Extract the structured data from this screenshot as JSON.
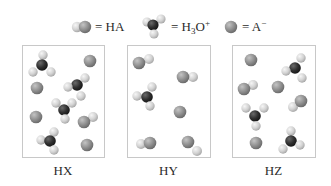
{
  "legend": [
    {
      "species": "HA",
      "label": "= HA",
      "type": "HA"
    },
    {
      "species": "H3O+",
      "label_main": "= H",
      "label_sub": "3",
      "label_mid": "O",
      "label_sup": "+",
      "type": "H3O"
    },
    {
      "species": "A-",
      "label_main": "= A",
      "label_sup": "−",
      "type": "A"
    }
  ],
  "colors": {
    "anion": "#8e8e8e",
    "anion_highlight": "#c4c4c4",
    "hydrogen": "#d6d6d6",
    "hydrogen_highlight": "#f4f4f4",
    "oxygen": "#2e2e2e",
    "oxygen_highlight": "#6a6a6a",
    "box_border": "#c8c8c8"
  },
  "boxes": [
    {
      "label": "HX",
      "x": 22,
      "y": 45,
      "w": 82,
      "h": 112,
      "counts": {
        "HA": 1,
        "H3O+": 4,
        "A-": 4
      },
      "molecules": [
        {
          "type": "H3O",
          "o": [
            42,
            65
          ],
          "h": [
            [
              43,
              55
            ],
            [
              33,
              72
            ],
            [
              51,
              72
            ]
          ]
        },
        {
          "type": "A",
          "at": [
            90,
            61
          ]
        },
        {
          "type": "A",
          "at": [
            37,
            88
          ]
        },
        {
          "type": "H3O",
          "o": [
            77,
            85
          ],
          "h": [
            [
              85,
              78
            ],
            [
              68,
              87
            ],
            [
              81,
              96
            ]
          ]
        },
        {
          "type": "H3O",
          "o": [
            64,
            110
          ],
          "h": [
            [
              56,
              103
            ],
            [
              72,
              103
            ],
            [
              65,
              119
            ]
          ]
        },
        {
          "type": "A",
          "at": [
            36,
            117
          ]
        },
        {
          "type": "HA",
          "a": [
            84,
            122
          ],
          "h": [
            93,
            117
          ]
        },
        {
          "type": "H3O",
          "o": [
            50,
            141
          ],
          "h": [
            [
              54,
              132
            ],
            [
              41,
              140
            ],
            [
              54,
              150
            ]
          ]
        },
        {
          "type": "A",
          "at": [
            87,
            145
          ]
        }
      ]
    },
    {
      "label": "HY",
      "x": 127,
      "y": 45,
      "w": 83,
      "h": 112,
      "counts": {
        "HA": 4,
        "H3O+": 1,
        "A-": 1
      },
      "molecules": [
        {
          "type": "HA",
          "a": [
            139,
            63
          ],
          "h": [
            149,
            59
          ]
        },
        {
          "type": "HA",
          "a": [
            183,
            77
          ],
          "h": [
            193,
            77
          ]
        },
        {
          "type": "H3O",
          "o": [
            147,
            97
          ],
          "h": [
            [
              152,
              87
            ],
            [
              137,
              96
            ],
            [
              150,
              106
            ]
          ]
        },
        {
          "type": "A",
          "at": [
            180,
            112
          ]
        },
        {
          "type": "HA",
          "a": [
            150,
            143
          ],
          "h": [
            141,
            144
          ]
        },
        {
          "type": "HA",
          "a": [
            188,
            142
          ],
          "h": [
            197,
            151
          ]
        }
      ]
    },
    {
      "label": "HZ",
      "x": 232,
      "y": 45,
      "w": 83,
      "h": 112,
      "counts": {
        "HA": 2,
        "H3O+": 3,
        "A-": 3
      },
      "molecules": [
        {
          "type": "A",
          "at": [
            251,
            60
          ]
        },
        {
          "type": "H3O",
          "o": [
            295,
            68
          ],
          "h": [
            [
              301,
              58
            ],
            [
              286,
              71
            ],
            [
              302,
              78
            ]
          ]
        },
        {
          "type": "HA",
          "a": [
            244,
            89
          ],
          "h": [
            253,
            85
          ]
        },
        {
          "type": "A",
          "at": [
            278,
            87
          ]
        },
        {
          "type": "HA",
          "a": [
            301,
            101
          ],
          "h": [
            293,
            107
          ]
        },
        {
          "type": "H3O",
          "o": [
            255,
            116
          ],
          "h": [
            [
              246,
              108
            ],
            [
              264,
              108
            ],
            [
              256,
              126
            ]
          ]
        },
        {
          "type": "A",
          "at": [
            256,
            143
          ]
        },
        {
          "type": "H3O",
          "o": [
            291,
            141
          ],
          "h": [
            [
              291,
              131
            ],
            [
              283,
              149
            ],
            [
              300,
              145
            ]
          ]
        }
      ]
    }
  ]
}
